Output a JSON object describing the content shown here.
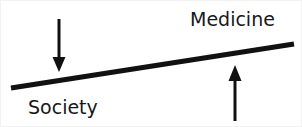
{
  "figure": {
    "width": 302,
    "height": 127,
    "background_color": "#ffffff",
    "stroke_color": "#111111",
    "labels": {
      "medicine": "Medicine",
      "society": "Society"
    },
    "icons": {
      "balance_beam": "tilted-beam",
      "down_arrow": "arrow-down-icon",
      "up_arrow": "arrow-up-icon"
    }
  },
  "diagram_data": {
    "type": "diagram",
    "description": "A tilted beam rising from lower-left to upper-right, labeled Society at the low left end and Medicine at the high right end, with a downward arrow pressing on the left end and an upward arrow lifting the right end.",
    "beam": {
      "x1": 10,
      "y1": 87,
      "x2": 293,
      "y2": 43,
      "thickness": 5,
      "color": "#111111"
    },
    "arrows": [
      {
        "name": "down-arrow",
        "direction": "down",
        "x": 58,
        "y_start": 18,
        "y_end": 71,
        "head_width": 13,
        "head_length": 14,
        "shaft_width": 3,
        "color": "#111111",
        "points_at": "Society"
      },
      {
        "name": "up-arrow",
        "direction": "up",
        "x": 234,
        "y_start": 120,
        "y_end": 64,
        "head_width": 13,
        "head_length": 15,
        "shaft_width": 3,
        "color": "#111111",
        "points_at": "Medicine"
      }
    ],
    "annotations": [
      {
        "text": "Medicine",
        "x": 189,
        "y": 9,
        "anchor": "top-left"
      },
      {
        "text": "Society",
        "x": 27,
        "y": 97,
        "anchor": "top-left"
      }
    ]
  }
}
